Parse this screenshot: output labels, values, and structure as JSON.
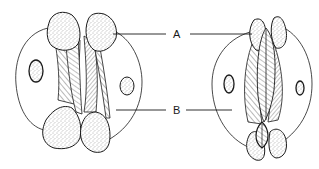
{
  "figure": {
    "labels": {
      "a": "A",
      "b": "B"
    },
    "left_panel": {
      "state": "open"
    },
    "right_panel": {
      "state": "closed"
    },
    "colors": {
      "stroke": "#1a1a1a",
      "stipple": "#6a6a6a",
      "background": "#ffffff"
    }
  }
}
